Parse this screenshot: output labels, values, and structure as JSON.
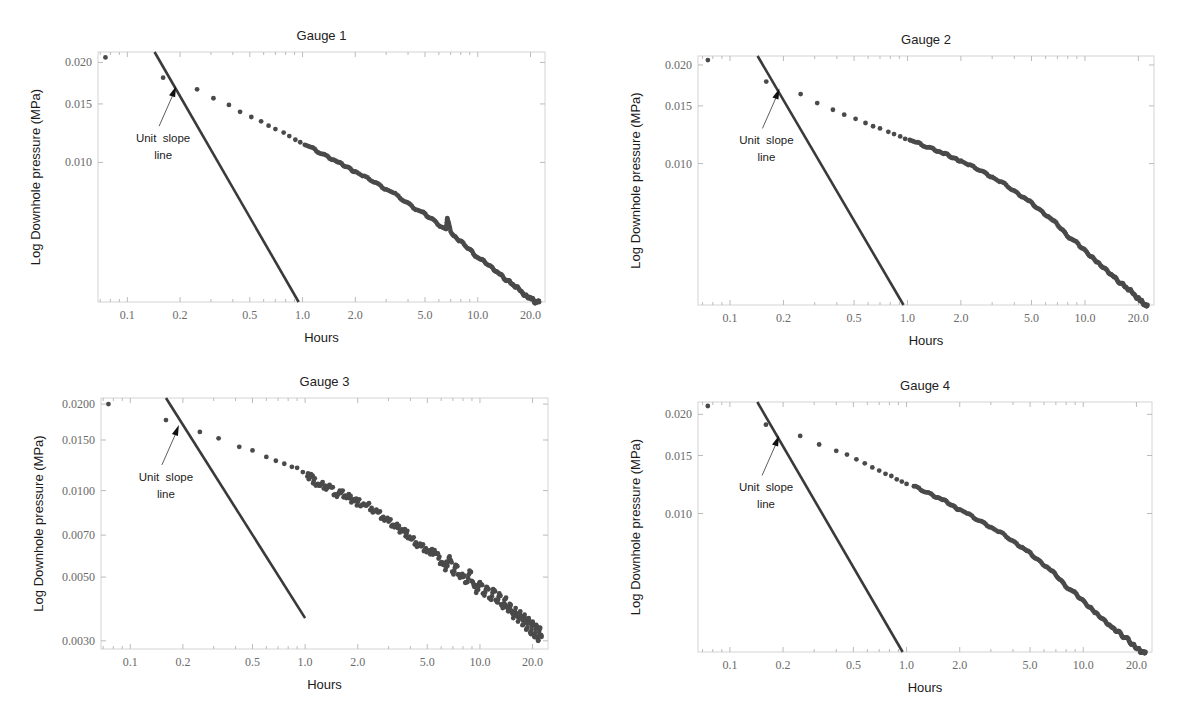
{
  "figure": {
    "panel_titles": [
      "Gauge 1",
      "Gauge 2",
      "Gauge 3",
      "Gauge 4"
    ]
  },
  "chart_data": [
    {
      "type": "scatter",
      "title": "Gauge 1",
      "xlabel": "Hours",
      "ylabel": "Log Downhole pressure (MPa)",
      "xscale": "log",
      "yscale": "log",
      "xlim": [
        0.068,
        24.2
      ],
      "ylim": [
        0.0038,
        0.0215
      ],
      "xticks": [
        0.1,
        0.2,
        0.5,
        1.0,
        2.0,
        5.0,
        10.0,
        20.0
      ],
      "xtick_labels": [
        "0.1",
        "0.2",
        "0.5",
        "1.0",
        "2.0",
        "5.0",
        "10.0",
        "20.0"
      ],
      "yticks": [
        0.02,
        0.015,
        0.01
      ],
      "ytick_labels": [
        "0.020",
        "0.015",
        "0.010"
      ],
      "grid": false,
      "marker_color": "#4a4a4a",
      "line_color": "#3a3a3a",
      "annotation": {
        "text_line1": "Unit  slope",
        "text_line2": "line",
        "arrow_target": [
          0.2,
          0.0172
        ],
        "text_pos": [
          0.16,
          0.0088
        ]
      },
      "reference_line": {
        "name": "Unit slope line",
        "x": [
          0.143,
          0.95
        ],
        "y": [
          0.0215,
          0.0038
        ]
      },
      "series": [
        {
          "name": "Gauge 1 data",
          "x": [
            0.075,
            0.16,
            0.25,
            0.31,
            0.38,
            0.44,
            0.51,
            0.58,
            0.64,
            0.7,
            0.78,
            0.84,
            0.91,
            0.97,
            1.03,
            1.12,
            1.2,
            1.3,
            1.4,
            1.5,
            1.6,
            1.7,
            1.8,
            1.9,
            2.0,
            2.2,
            2.4,
            2.6,
            2.8,
            3.0,
            3.3,
            3.6,
            3.9,
            4.2,
            4.5,
            4.8,
            5.1,
            5.4,
            5.8,
            6.2,
            6.6,
            6.7,
            6.8,
            7.0,
            7.4,
            7.8,
            8.3,
            8.8,
            9.3,
            9.8,
            10.4,
            11.0,
            11.6,
            12.2,
            12.8,
            13.4,
            14.0,
            14.6,
            15.2,
            15.8,
            16.4,
            17.0,
            17.6,
            18.2,
            18.8,
            19.4,
            20.0,
            20.5,
            21.0,
            21.5,
            22.0,
            22.4
          ],
          "y": [
            0.0207,
            0.018,
            0.0166,
            0.0156,
            0.0149,
            0.0142,
            0.0137,
            0.0133,
            0.0129,
            0.0126,
            0.0123,
            0.012,
            0.0117,
            0.0115,
            0.0113,
            0.0111,
            0.0108,
            0.0106,
            0.0104,
            0.0102,
            0.01,
            0.0098,
            0.0097,
            0.0095,
            0.0094,
            0.0091,
            0.0089,
            0.0087,
            0.0085,
            0.0083,
            0.0081,
            0.0078,
            0.0076,
            0.0074,
            0.0072,
            0.0071,
            0.0069,
            0.0068,
            0.0066,
            0.0064,
            0.0063,
            0.0068,
            0.0066,
            0.0062,
            0.006,
            0.0058,
            0.0057,
            0.0055,
            0.0054,
            0.0052,
            0.0051,
            0.005,
            0.0049,
            0.0048,
            0.0047,
            0.0046,
            0.0045,
            0.0044,
            0.0044,
            0.0043,
            0.0042,
            0.0042,
            0.0041,
            0.004,
            0.004,
            0.0039,
            0.0039,
            0.0039,
            0.0038,
            0.0038,
            0.0038,
            0.0038
          ]
        }
      ]
    },
    {
      "type": "scatter",
      "title": "Gauge 2",
      "xlabel": "Hours",
      "ylabel": "Log Downhole pressure (MPa)",
      "xscale": "log",
      "yscale": "log",
      "xlim": [
        0.066,
        24.5
      ],
      "ylim": [
        0.0037,
        0.0213
      ],
      "xticks": [
        0.1,
        0.2,
        0.5,
        1.0,
        2.0,
        5.0,
        10.0,
        20.0
      ],
      "xtick_labels": [
        "0.1",
        "0.2",
        "0.5",
        "1.0",
        "2.0",
        "5.0",
        "10.0",
        "20.0"
      ],
      "yticks": [
        0.02,
        0.015,
        0.01
      ],
      "ytick_labels": [
        "0.020",
        "0.015",
        "0.010"
      ],
      "grid": false,
      "marker_color": "#4a4a4a",
      "line_color": "#3a3a3a",
      "annotation": {
        "text_line1": "Unit  slope",
        "text_line2": "line",
        "arrow_target": [
          0.2,
          0.0172
        ],
        "text_pos": [
          0.16,
          0.0088
        ]
      },
      "reference_line": {
        "name": "Unit slope line",
        "x": [
          0.143,
          0.95
        ],
        "y": [
          0.0213,
          0.0037
        ]
      },
      "series": [
        {
          "name": "Gauge 2 data",
          "x": [
            0.075,
            0.16,
            0.25,
            0.31,
            0.38,
            0.44,
            0.51,
            0.58,
            0.64,
            0.7,
            0.78,
            0.84,
            0.91,
            0.97,
            1.03,
            1.12,
            1.2,
            1.3,
            1.4,
            1.5,
            1.6,
            1.7,
            1.8,
            1.9,
            2.0,
            2.2,
            2.4,
            2.6,
            2.8,
            3.0,
            3.3,
            3.6,
            3.9,
            4.2,
            4.5,
            4.8,
            5.1,
            5.4,
            5.8,
            6.2,
            6.6,
            7.0,
            7.4,
            7.8,
            8.3,
            8.8,
            9.3,
            9.8,
            10.4,
            11.0,
            11.6,
            12.2,
            12.8,
            13.4,
            14.0,
            14.6,
            15.2,
            15.8,
            16.4,
            17.0,
            17.6,
            18.2,
            18.8,
            19.4,
            20.0,
            20.5,
            21.0,
            21.5,
            22.0,
            22.5
          ],
          "y": [
            0.0207,
            0.0178,
            0.0163,
            0.0153,
            0.0146,
            0.0141,
            0.0137,
            0.0133,
            0.013,
            0.0128,
            0.0125,
            0.0123,
            0.0121,
            0.0119,
            0.0118,
            0.0116,
            0.0114,
            0.0112,
            0.0111,
            0.0109,
            0.0107,
            0.0106,
            0.0104,
            0.0103,
            0.0102,
            0.0099,
            0.0097,
            0.0095,
            0.0093,
            0.0091,
            0.0088,
            0.0086,
            0.0083,
            0.0081,
            0.0079,
            0.0077,
            0.0075,
            0.0073,
            0.0071,
            0.0069,
            0.0067,
            0.0065,
            0.0063,
            0.0061,
            0.0059,
            0.0058,
            0.0056,
            0.0055,
            0.0053,
            0.0052,
            0.005,
            0.0049,
            0.0048,
            0.0047,
            0.0046,
            0.0045,
            0.0044,
            0.0043,
            0.0043,
            0.0042,
            0.0041,
            0.0041,
            0.004,
            0.0039,
            0.0039,
            0.0038,
            0.0038,
            0.0037,
            0.0037,
            0.0037
          ]
        }
      ]
    },
    {
      "type": "scatter",
      "title": "Gauge 3",
      "xlabel": "Hours",
      "ylabel": "Log Downhole pressure (MPa)",
      "xscale": "log",
      "yscale": "log",
      "xlim": [
        0.068,
        24.5
      ],
      "ylim": [
        0.00281,
        0.021
      ],
      "xticks": [
        0.1,
        0.2,
        0.5,
        1.0,
        2.0,
        5.0,
        10.0,
        20.0
      ],
      "xtick_labels": [
        "0.1",
        "0.2",
        "0.5",
        "1.0",
        "2.0",
        "5.0",
        "10.0",
        "20.0"
      ],
      "yticks": [
        0.02,
        0.015,
        0.01,
        0.007,
        0.005,
        0.003
      ],
      "ytick_labels": [
        "0.0200",
        "0.0150",
        "0.0100",
        "0.0070",
        "0.0050",
        "0.0030"
      ],
      "grid": false,
      "marker_color": "#4a4a4a",
      "line_color": "#3a3a3a",
      "annotation": {
        "text_line1": "Unit  slope",
        "text_line2": "line",
        "arrow_target": [
          0.2,
          0.0172
        ],
        "text_pos": [
          0.16,
          0.0104
        ]
      },
      "reference_line": {
        "name": "Unit slope line",
        "x": [
          0.16,
          1.0
        ],
        "y": [
          0.021,
          0.0036
        ]
      },
      "series": [
        {
          "name": "Gauge 3 data",
          "x": [
            0.075,
            0.16,
            0.25,
            0.32,
            0.42,
            0.5,
            0.6,
            0.68,
            0.76,
            0.84,
            0.9,
            0.97,
            1.03,
            1.08,
            1.12,
            1.2,
            1.3,
            1.4,
            1.5,
            1.6,
            1.7,
            1.8,
            1.9,
            2.0,
            2.2,
            2.4,
            2.6,
            2.8,
            3.0,
            3.2,
            3.4,
            3.6,
            3.8,
            4.0,
            4.3,
            4.6,
            4.9,
            5.2,
            5.5,
            5.8,
            6.1,
            6.4,
            6.7,
            7.0,
            7.3,
            7.6,
            8.0,
            8.4,
            8.8,
            9.2,
            9.6,
            10.0,
            10.5,
            11.0,
            11.5,
            12.0,
            12.5,
            13.0,
            13.5,
            14.0,
            14.5,
            15.0,
            15.5,
            16.0,
            16.5,
            17.0,
            17.5,
            18.0,
            18.5,
            19.0,
            19.5,
            20.0,
            20.5,
            21.0,
            21.5,
            22.0,
            22.5
          ],
          "y": [
            0.02,
            0.0176,
            0.016,
            0.0152,
            0.0142,
            0.0138,
            0.0131,
            0.0127,
            0.0124,
            0.0121,
            0.012,
            0.0116,
            0.0112,
            0.0114,
            0.0108,
            0.0104,
            0.0104,
            0.0103,
            0.0097,
            0.0098,
            0.0096,
            0.0094,
            0.0093,
            0.0091,
            0.0089,
            0.0087,
            0.0084,
            0.0081,
            0.0078,
            0.0076,
            0.0074,
            0.0073,
            0.0071,
            0.0068,
            0.0066,
            0.0064,
            0.0063,
            0.006,
            0.0062,
            0.0058,
            0.0056,
            0.0054,
            0.0059,
            0.0052,
            0.0055,
            0.0051,
            0.005,
            0.0048,
            0.0052,
            0.0047,
            0.0045,
            0.0048,
            0.0044,
            0.0046,
            0.0042,
            0.0045,
            0.0041,
            0.0043,
            0.0039,
            0.0042,
            0.0038,
            0.004,
            0.0036,
            0.0039,
            0.0035,
            0.0038,
            0.0034,
            0.0037,
            0.0033,
            0.0036,
            0.0032,
            0.0035,
            0.0031,
            0.0034,
            0.003,
            0.0033,
            0.0031
          ]
        }
      ]
    },
    {
      "type": "scatter",
      "title": "Gauge 4",
      "xlabel": "Hours",
      "ylabel": "Log Downhole pressure (MPa)",
      "xscale": "log",
      "yscale": "log",
      "xlim": [
        0.066,
        24.5
      ],
      "ylim": [
        0.0038,
        0.0218
      ],
      "xticks": [
        0.1,
        0.2,
        0.5,
        1.0,
        2.0,
        5.0,
        10.0,
        20.0
      ],
      "xtick_labels": [
        "0.1",
        "0.2",
        "0.5",
        "1.0",
        "2.0",
        "5.0",
        "10.0",
        "20.0"
      ],
      "yticks": [
        0.02,
        0.015,
        0.01
      ],
      "ytick_labels": [
        "0.020",
        "0.015",
        "0.010"
      ],
      "grid": false,
      "marker_color": "#4a4a4a",
      "line_color": "#3a3a3a",
      "annotation": {
        "text_line1": "Unit  slope",
        "text_line2": "line",
        "arrow_target": [
          0.2,
          0.0175
        ],
        "text_pos": [
          0.16,
          0.0089
        ]
      },
      "reference_line": {
        "name": "Unit slope line",
        "x": [
          0.143,
          0.95
        ],
        "y": [
          0.0218,
          0.0038
        ]
      },
      "series": [
        {
          "name": "Gauge 4 data",
          "x": [
            0.075,
            0.16,
            0.25,
            0.32,
            0.4,
            0.46,
            0.52,
            0.58,
            0.64,
            0.7,
            0.76,
            0.82,
            0.88,
            0.94,
            1.0,
            1.1,
            1.2,
            1.3,
            1.4,
            1.5,
            1.6,
            1.7,
            1.8,
            1.9,
            2.0,
            2.2,
            2.4,
            2.6,
            2.8,
            3.0,
            3.3,
            3.6,
            3.9,
            4.2,
            4.5,
            4.8,
            5.1,
            5.4,
            5.8,
            6.2,
            6.6,
            7.0,
            7.4,
            7.8,
            8.3,
            8.8,
            9.3,
            9.8,
            10.4,
            11.0,
            11.6,
            12.2,
            12.8,
            13.4,
            14.0,
            14.6,
            15.2,
            15.8,
            16.4,
            17.0,
            17.6,
            18.2,
            18.8,
            19.4,
            20.0,
            20.5,
            21.0,
            21.5,
            22.0,
            22.5
          ],
          "y": [
            0.0212,
            0.0186,
            0.0172,
            0.0162,
            0.0155,
            0.0151,
            0.0146,
            0.0142,
            0.0138,
            0.0135,
            0.0132,
            0.013,
            0.0127,
            0.0125,
            0.0123,
            0.0121,
            0.0118,
            0.0116,
            0.0114,
            0.0112,
            0.011,
            0.0108,
            0.0106,
            0.0104,
            0.0103,
            0.01,
            0.0097,
            0.0095,
            0.0093,
            0.0091,
            0.0088,
            0.0086,
            0.0083,
            0.0081,
            0.0079,
            0.0077,
            0.0075,
            0.0073,
            0.0071,
            0.0069,
            0.0067,
            0.0065,
            0.0063,
            0.0061,
            0.0059,
            0.0058,
            0.0056,
            0.0055,
            0.0053,
            0.0052,
            0.005,
            0.0049,
            0.0048,
            0.0047,
            0.0046,
            0.0045,
            0.0044,
            0.0044,
            0.0043,
            0.0042,
            0.0042,
            0.0041,
            0.004,
            0.004,
            0.0039,
            0.0039,
            0.0038,
            0.0038,
            0.0038,
            0.0038
          ]
        }
      ]
    }
  ]
}
